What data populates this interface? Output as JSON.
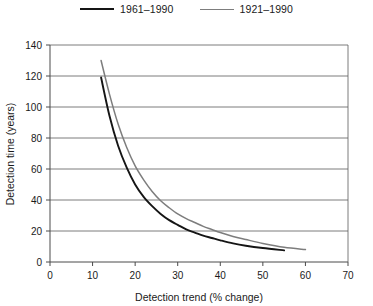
{
  "chart_data": {
    "type": "line",
    "title": "",
    "xlabel": "Detection trend (% change)",
    "ylabel": "Detection time (years)",
    "xlim": [
      0,
      70
    ],
    "ylim": [
      0,
      140
    ],
    "xticks": [
      0,
      10,
      20,
      30,
      40,
      50,
      60,
      70
    ],
    "yticks": [
      0,
      20,
      40,
      60,
      80,
      100,
      120,
      140
    ],
    "grid": "horizontal",
    "legend_position": "top-center",
    "series": [
      {
        "name": "1961–1990",
        "color": "#151515",
        "x": [
          12,
          14,
          16,
          18,
          20,
          22,
          24,
          26,
          28,
          30,
          32,
          34,
          36,
          38,
          40,
          43,
          46,
          50,
          55
        ],
        "y": [
          119,
          94,
          75,
          61,
          50,
          42,
          36,
          31,
          27,
          24,
          21,
          19,
          17,
          15.5,
          14,
          12,
          10.5,
          9,
          7.5
        ]
      },
      {
        "name": "1921–1990",
        "color": "#7d7d7d",
        "x": [
          12,
          14,
          16,
          18,
          20,
          22,
          24,
          26,
          28,
          30,
          32,
          34,
          36,
          38,
          40,
          43,
          46,
          50,
          55,
          60
        ],
        "y": [
          130,
          108,
          89,
          74,
          62,
          53,
          45.5,
          39.5,
          35,
          31,
          28,
          25.5,
          23,
          21,
          19,
          16.5,
          14.5,
          12,
          9.5,
          8
        ]
      }
    ]
  },
  "legend": {
    "entries": [
      {
        "label": "1961–1990"
      },
      {
        "label": "1921–1990"
      }
    ]
  },
  "axes": {
    "x_title": "Detection trend (% change)",
    "y_title": "Detection time (years)",
    "x_tick_labels": [
      "0",
      "10",
      "20",
      "30",
      "40",
      "50",
      "60",
      "70"
    ],
    "y_tick_labels": [
      "0",
      "20",
      "40",
      "60",
      "80",
      "100",
      "120",
      "140"
    ]
  }
}
